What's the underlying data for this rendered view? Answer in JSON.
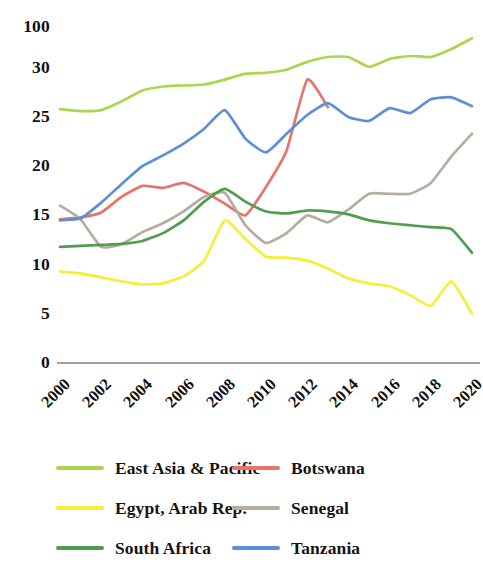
{
  "chart_data": {
    "type": "line",
    "title": "",
    "subtitle": "",
    "xlabel": "",
    "ylabel": "",
    "grid": false,
    "legend_position": "bottom",
    "x": [
      2000,
      2001,
      2002,
      2003,
      2004,
      2005,
      2006,
      2007,
      2008,
      2009,
      2010,
      2011,
      2012,
      2013,
      2014,
      2015,
      2016,
      2017,
      2018,
      2019,
      2020
    ],
    "xtick_labels": [
      "2000",
      "2002",
      "2004",
      "2006",
      "2008",
      "2010",
      "2012",
      "2014",
      "2016",
      "2018",
      "2020"
    ],
    "xlim": [
      2000,
      2020
    ],
    "ytick_labels": [
      "0",
      "5",
      "10",
      "15",
      "20",
      "25",
      "30",
      "100"
    ],
    "ytick_values": [
      0,
      5,
      10,
      15,
      20,
      25,
      30,
      100
    ],
    "ylim": [
      0,
      35
    ],
    "series": [
      {
        "name": "East Asia & Pacific",
        "color": "#a9d84e",
        "values": [
          25.8,
          25.6,
          25.7,
          26.6,
          27.7,
          28.1,
          28.2,
          28.3,
          28.8,
          29.4,
          29.5,
          29.8,
          30.6,
          31.1,
          31.1,
          30.1,
          30.9,
          31.2,
          31.1,
          31.9,
          33.0
        ]
      },
      {
        "name": "Botswana",
        "color": "#e8736b",
        "values": [
          14.6,
          14.8,
          15.3,
          16.9,
          18.0,
          17.8,
          18.3,
          17.4,
          16.2,
          15.0,
          17.9,
          21.6,
          28.8,
          26.0,
          null,
          null,
          null,
          null,
          null,
          null,
          null
        ]
      },
      {
        "name": "Egypt, Arab Rep.",
        "color": "#f5ef3a",
        "values": [
          9.3,
          9.1,
          8.7,
          8.3,
          8.0,
          8.1,
          8.8,
          10.4,
          14.5,
          12.6,
          10.8,
          10.7,
          10.4,
          9.6,
          8.6,
          8.1,
          7.8,
          6.9,
          5.8,
          8.3,
          5.0
        ]
      },
      {
        "name": "Senegal",
        "color": "#b5ada0",
        "values": [
          16.0,
          14.6,
          11.8,
          12.1,
          13.3,
          14.2,
          15.4,
          16.9,
          17.3,
          14.0,
          12.2,
          13.2,
          15.0,
          14.3,
          15.6,
          17.2,
          17.2,
          17.2,
          18.3,
          21.0,
          23.3
        ]
      },
      {
        "name": "South Africa",
        "color": "#4f9e4f",
        "values": [
          11.8,
          11.9,
          12.0,
          12.1,
          12.4,
          13.2,
          14.5,
          16.4,
          17.7,
          16.4,
          15.4,
          15.2,
          15.5,
          15.4,
          15.1,
          14.5,
          14.2,
          14.0,
          13.8,
          13.6,
          11.2
        ]
      },
      {
        "name": "Tanzania",
        "color": "#5b8fd6",
        "values": [
          14.5,
          14.7,
          16.3,
          18.2,
          20.0,
          21.1,
          22.3,
          23.8,
          25.7,
          22.8,
          21.4,
          23.3,
          25.2,
          26.4,
          25.0,
          24.6,
          25.9,
          25.4,
          26.8,
          27.0,
          26.1
        ]
      }
    ],
    "axis_line_color": "#808080",
    "background_color": "#ffffff"
  },
  "legend": {
    "rows": [
      {
        "left": {
          "label": "East Asia & Pacific",
          "color": "#a9d84e"
        },
        "right": {
          "label": "Botswana",
          "color": "#e8736b"
        }
      },
      {
        "left": {
          "label": "Egypt, Arab Rep.",
          "color": "#f5ef3a"
        },
        "right": {
          "label": "Senegal",
          "color": "#b5ada0"
        }
      },
      {
        "left": {
          "label": "South Africa",
          "color": "#4f9e4f"
        },
        "right": {
          "label": "Tanzania",
          "color": "#5b8fd6"
        }
      }
    ]
  }
}
